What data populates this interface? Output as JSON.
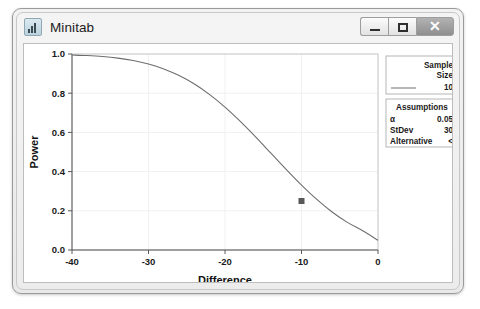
{
  "window": {
    "title": "Minitab",
    "icon": "bar-chart-icon",
    "controls": {
      "minimize": "–",
      "maximize": "□",
      "close": "✕"
    }
  },
  "legend": {
    "sample_size": {
      "header_line1": "Sample",
      "header_line2": "Size",
      "value": "10",
      "swatch": "line-swatch"
    },
    "assumptions": {
      "title": "Assumptions",
      "rows": [
        {
          "label": "α",
          "value": "0.05"
        },
        {
          "label": "StDev",
          "value": "30"
        },
        {
          "label": "Alternative",
          "value": "<"
        }
      ]
    }
  },
  "chart_data": {
    "type": "line",
    "title": "",
    "xlabel": "Difference",
    "ylabel": "Power",
    "xlim": [
      -40,
      0
    ],
    "ylim": [
      0.0,
      1.0
    ],
    "xticks": [
      -40,
      -30,
      -20,
      -10,
      0
    ],
    "xtick_labels": [
      "-40",
      "-30",
      "-20",
      "-10",
      "0"
    ],
    "yticks": [
      0.0,
      0.2,
      0.4,
      0.6,
      0.8,
      1.0
    ],
    "ytick_labels": [
      "0.0",
      "0.2",
      "0.4",
      "0.6",
      "0.8",
      "1.0"
    ],
    "grid": true,
    "legend_position": "right",
    "line_color": "#6e6e6e",
    "marker_color": "#595959",
    "series": [
      {
        "name": "Sample Size 10",
        "x": [
          -40,
          -38,
          -36,
          -34,
          -32,
          -30,
          -28,
          -26,
          -24,
          -22,
          -20,
          -18,
          -16,
          -14,
          -12,
          -10,
          -8,
          -6,
          -4,
          -2,
          0
        ],
        "y": [
          0.995,
          0.992,
          0.987,
          0.979,
          0.967,
          0.949,
          0.924,
          0.89,
          0.847,
          0.793,
          0.729,
          0.656,
          0.577,
          0.494,
          0.411,
          0.331,
          0.258,
          0.194,
          0.141,
          0.098,
          0.05
        ]
      }
    ],
    "annotations": [
      {
        "name": "power-point-marker",
        "x": -10,
        "y": 0.25,
        "marker": "square"
      }
    ]
  }
}
